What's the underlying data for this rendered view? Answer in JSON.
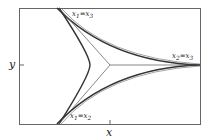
{
  "diagram": {
    "axes": {
      "x_label": "x",
      "y_label": "y"
    },
    "curve_labels": {
      "top": {
        "main": "x",
        "sub1": "1",
        "eq": "=",
        "main2": "x",
        "sub2": "3"
      },
      "right": {
        "main": "x",
        "sub1": "2",
        "eq": "=",
        "main2": "x",
        "sub2": "3"
      },
      "bottom": {
        "main": "x",
        "sub1": "1",
        "eq": "=",
        "main2": "x",
        "sub2": "2"
      }
    },
    "colors": {
      "curve": "#3a3a3a",
      "frame": "#555555"
    }
  }
}
